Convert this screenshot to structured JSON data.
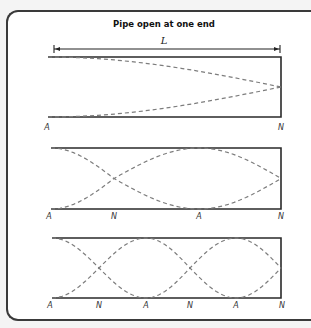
{
  "title": "Pipe open at one end",
  "length_label": "L",
  "colors": {
    "frame": "#3a3a3a",
    "pipe": "#2a2a2a",
    "wave": "#7d7d7d",
    "background": "#ffffff"
  },
  "dimension_arrow": {
    "x1": 54,
    "x2": 280,
    "y": 49
  },
  "pipes": [
    {
      "name": "fundamental",
      "x_start": 48,
      "x_end": 281,
      "y_top": 57,
      "y_bottom": 117,
      "quarter_wavelengths": 1,
      "labels": [
        {
          "text": "A",
          "x": 47
        },
        {
          "text": "N",
          "x": 281
        }
      ],
      "label_y": 130
    },
    {
      "name": "third-harmonic",
      "x_start": 51,
      "x_end": 281,
      "y_top": 148,
      "y_bottom": 209,
      "quarter_wavelengths": 3,
      "labels": [
        {
          "text": "A",
          "x": 49
        },
        {
          "text": "N",
          "x": 114
        },
        {
          "text": "A",
          "x": 199
        },
        {
          "text": "N",
          "x": 281
        }
      ],
      "label_y": 219
    },
    {
      "name": "fifth-harmonic",
      "x_start": 52,
      "x_end": 281,
      "y_top": 238,
      "y_bottom": 298,
      "quarter_wavelengths": 5,
      "labels": [
        {
          "text": "A",
          "x": 50
        },
        {
          "text": "N",
          "x": 99
        },
        {
          "text": "A",
          "x": 146
        },
        {
          "text": "N",
          "x": 190
        },
        {
          "text": "A",
          "x": 236
        },
        {
          "text": "N",
          "x": 282
        }
      ],
      "label_y": 308
    }
  ]
}
